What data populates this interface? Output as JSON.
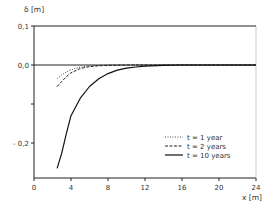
{
  "chart_data": {
    "type": "line",
    "title": "",
    "xlabel": "x [m]",
    "ylabel": "δ [m]",
    "xlim": [
      0,
      24
    ],
    "ylim": [
      -0.29,
      0.1
    ],
    "x_ticks": [
      "0",
      "4",
      "8",
      "12",
      "16",
      "20",
      "24"
    ],
    "y_ticks": [
      "0,1",
      "0,0",
      "-0,2"
    ],
    "y_tick_values": [
      0.1,
      0.0,
      -0.1,
      -0.2
    ],
    "grid": false,
    "reference_lines": [
      0.1,
      0.0
    ],
    "legend_position": "lower right",
    "series": [
      {
        "name": "t = 1 year",
        "style": "dotted",
        "x": [
          2.5,
          3,
          3.5,
          4,
          5,
          6,
          7,
          8,
          10,
          12,
          16,
          20,
          24
        ],
        "y": [
          -0.035,
          -0.025,
          -0.018,
          -0.012,
          -0.005,
          -0.002,
          -0.001,
          0.0,
          0.0,
          0.0,
          0.0,
          0.0,
          0.0
        ]
      },
      {
        "name": "t = 2 years",
        "style": "dashed",
        "x": [
          2.5,
          3,
          3.5,
          4,
          5,
          6,
          7,
          8,
          10,
          12,
          16,
          20,
          24
        ],
        "y": [
          -0.055,
          -0.042,
          -0.03,
          -0.02,
          -0.009,
          -0.004,
          -0.002,
          -0.001,
          0.0,
          0.0,
          0.0,
          0.0,
          0.0
        ]
      },
      {
        "name": "t = 10 years",
        "style": "solid",
        "x": [
          2.5,
          3,
          3.5,
          4,
          5,
          6,
          7,
          8,
          9,
          10,
          11,
          12,
          14,
          16,
          20,
          24
        ],
        "y": [
          -0.265,
          -0.225,
          -0.175,
          -0.13,
          -0.085,
          -0.055,
          -0.035,
          -0.022,
          -0.013,
          -0.008,
          -0.005,
          -0.003,
          -0.001,
          0.0,
          0.0,
          0.0
        ]
      }
    ]
  },
  "labels": {
    "ylabel": "δ [m]",
    "xlabel": "x [m]",
    "ytick_top": "0,1",
    "ytick_zero": "0,0",
    "ytick_m02": "- 0,2",
    "xticks": [
      "0",
      "4",
      "8",
      "12",
      "16",
      "20",
      "24"
    ],
    "legend": [
      "t = 1 year",
      "t = 2 years",
      "t = 10 years"
    ]
  }
}
